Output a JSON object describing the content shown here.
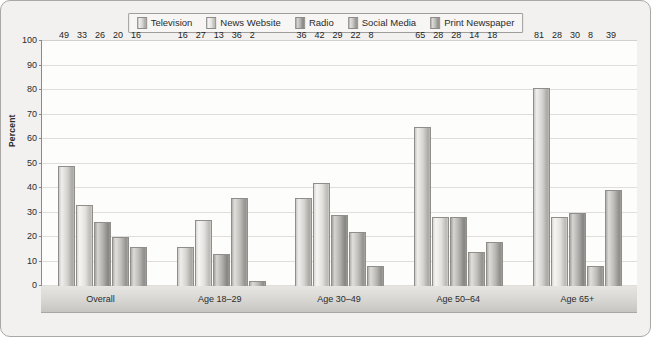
{
  "chart_data": {
    "type": "bar",
    "title": "",
    "subtitle": "",
    "xlabel": "",
    "ylabel": "Percent",
    "ylim": [
      0,
      100
    ],
    "ytick_step": 10,
    "yticks": [
      100,
      90,
      80,
      70,
      60,
      50,
      40,
      30,
      20,
      10,
      0
    ],
    "grid": true,
    "legend_position": "top-center",
    "value_labels": true,
    "categories": [
      "Overall",
      "Age 18–29",
      "Age 30–49",
      "Age 50–64",
      "Age 65+"
    ],
    "series": [
      {
        "name": "Television",
        "color": "#cfcecb",
        "values": [
          49,
          16,
          36,
          65,
          81
        ]
      },
      {
        "name": "News Website",
        "color": "#e3e2df",
        "values": [
          33,
          27,
          42,
          28,
          28
        ]
      },
      {
        "name": "Radio",
        "color": "#a5a4a1",
        "values": [
          26,
          13,
          29,
          28,
          30
        ]
      },
      {
        "name": "Social Media",
        "color": "#bdbcb9",
        "values": [
          20,
          36,
          22,
          14,
          8
        ]
      },
      {
        "name": "Print Newspaper",
        "color": "#b4b3b0",
        "values": [
          16,
          2,
          8,
          18,
          39
        ]
      }
    ]
  },
  "frame": {
    "background": "#f2f1ef",
    "border_color": "#a9a8a5",
    "plot_background": "#fdfdfc",
    "gridline_color": "#dfdedb",
    "axis_color": "#8a8a87"
  }
}
